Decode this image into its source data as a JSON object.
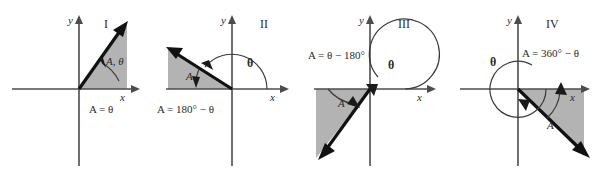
{
  "figure": {
    "colors": {
      "shaded_region": "#b3b3b3",
      "axis": "#4c4c4c",
      "vector": "#111111",
      "background": "#ffffff"
    },
    "panels": [
      {
        "id": "quadrant-1",
        "roman": "I",
        "x_axis_label": "x",
        "y_axis_label": "y",
        "angle_label": "A, θ",
        "equation": "A = θ",
        "equation_parts": {
          "lhs": "A",
          "eq": "=",
          "rhs": "θ"
        },
        "vector_angle_deg": 55,
        "arc_sweep": "counterclockwise from +x axis to vector"
      },
      {
        "id": "quadrant-2",
        "roman": "II",
        "x_axis_label": "x",
        "y_axis_label": "y",
        "angle_label": "θ",
        "reference_label": "A",
        "equation": "A = 180° − θ",
        "equation_parts": {
          "lhs": "A",
          "eq": "=",
          "rhs": "180° − θ"
        },
        "vector_angle_deg": 152,
        "arc_sweep": "counterclockwise from +x axis to vector"
      },
      {
        "id": "quadrant-3",
        "roman": "III",
        "x_axis_label": "x",
        "y_axis_label": "y",
        "angle_label": "θ",
        "reference_label": "A",
        "equation": "A = θ − 180°",
        "equation_parts": {
          "lhs": "A",
          "eq": "=",
          "rhs": "θ − 180°"
        },
        "vector_angle_deg": 230,
        "arc_sweep": "counterclockwise from +x axis to vector"
      },
      {
        "id": "quadrant-4",
        "roman": "IV",
        "x_axis_label": "x",
        "y_axis_label": "y",
        "angle_label": "θ",
        "reference_label": "A",
        "equation": "A = 360° − θ",
        "equation_parts": {
          "lhs": "A",
          "eq": "=",
          "rhs": "360° − θ"
        },
        "vector_angle_deg": 311,
        "arc_sweep": "counterclockwise from +x axis to vector"
      }
    ]
  }
}
